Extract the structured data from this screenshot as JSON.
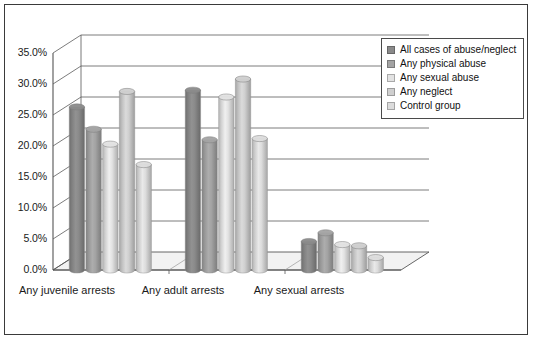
{
  "chart_data": {
    "type": "bar",
    "title": "",
    "subtitle": "",
    "xlabel": "",
    "ylabel": "",
    "categories": [
      "Any juvenile arrests",
      "Any adult arrests",
      "Any sexual arrests"
    ],
    "series": [
      {
        "name": "All cases of abuse/neglect",
        "color": "#8a8a8a",
        "values": [
          26.3,
          29.0,
          4.6
        ]
      },
      {
        "name": "Any physical abuse",
        "color": "#a3a3a3",
        "values": [
          22.7,
          21.0,
          6.0
        ]
      },
      {
        "name": "Any sexual abuse",
        "color": "#e2e2e2",
        "values": [
          20.3,
          27.9,
          4.1
        ]
      },
      {
        "name": "Any neglect",
        "color": "#cfcfcf",
        "values": [
          28.8,
          30.8,
          3.9
        ]
      },
      {
        "name": "Control group",
        "color": "#dcdcdc",
        "values": [
          17.0,
          21.2,
          2.0
        ]
      }
    ],
    "ylim": [
      0,
      35
    ],
    "ytick_values": [
      0,
      5,
      10,
      15,
      20,
      25,
      30,
      35
    ],
    "ytick_labels": [
      "0.0%",
      "5.0%",
      "10.0%",
      "15.0%",
      "20.0%",
      "25.0%",
      "30.0%",
      "35.0%"
    ],
    "grid": true,
    "grid_axis": "y",
    "legend_position": "top-right",
    "three_d": true,
    "bar_shape": "cylinder"
  },
  "legend": {
    "items": [
      {
        "label": "All cases of abuse/neglect",
        "swatch": "#8a8a8a"
      },
      {
        "label": "Any physical abuse",
        "swatch": "#a3a3a3"
      },
      {
        "label": "Any sexual abuse",
        "swatch": "#e2e2e2"
      },
      {
        "label": "Any neglect",
        "swatch": "#cfcfcf"
      },
      {
        "label": "Control group",
        "swatch": "#dcdcdc"
      }
    ]
  },
  "colors": {
    "frame_border": "#3a3a3a",
    "axis_line": "#555555",
    "gridline": "#5a5a5a",
    "floor": "#f2f2f2",
    "background": "#ffffff",
    "text": "#1a1a1a"
  }
}
